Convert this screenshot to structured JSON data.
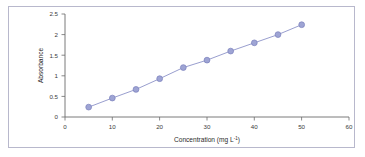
{
  "chart_data": {
    "type": "line",
    "title": "",
    "subtitle": "",
    "xlabel": "Concentration (mg L",
    "xlabel_sup": "-1",
    "xlabel_tail": ")",
    "xlabel_full": "Concentration (mg L⁻¹)",
    "ylabel": "Absorbance",
    "xlim": [
      0,
      60
    ],
    "ylim": [
      0,
      2.5
    ],
    "xticks": [
      "0",
      "10",
      "20",
      "30",
      "40",
      "50",
      "60"
    ],
    "xtick_values": [
      0,
      10,
      20,
      30,
      40,
      50,
      60
    ],
    "yticks": [
      "0",
      "0.5",
      "1",
      "1.5",
      "2",
      "2.5"
    ],
    "ytick_values": [
      0,
      0.5,
      1,
      1.5,
      2,
      2.5
    ],
    "grid": false,
    "legend": false,
    "legend_position": "none",
    "markers": "circle",
    "series": [
      {
        "name": "Calibration curve",
        "color": "#8d93c8",
        "marker_fill": "#9ea4d4",
        "marker_edge": "#7a80bb",
        "x": [
          5,
          10,
          15,
          20,
          25,
          30,
          35,
          40,
          45,
          50
        ],
        "values": [
          0.24,
          0.46,
          0.67,
          0.93,
          1.2,
          1.38,
          1.6,
          1.8,
          2.0,
          2.24
        ]
      }
    ],
    "annotations": []
  },
  "figure": {
    "border_color": "#b8b8cc",
    "background": "#ffffff",
    "axis_color": "#6b6b6b",
    "accent_color": "#8d93c8"
  }
}
